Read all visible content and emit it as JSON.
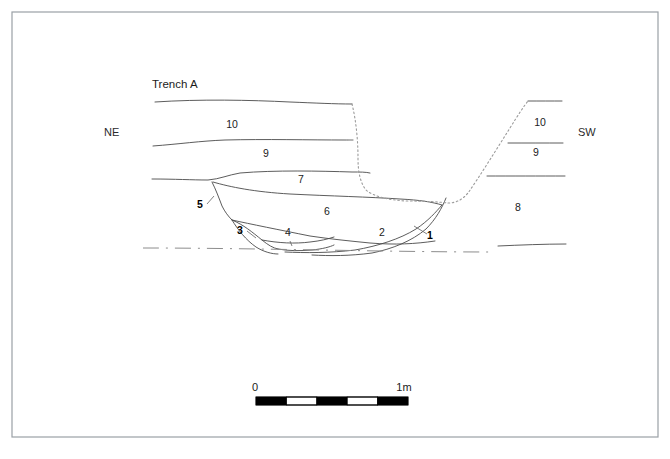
{
  "figure": {
    "title": "Trench A",
    "frame": {
      "x": 12,
      "y": 12,
      "width": 646,
      "height": 425,
      "color": "#9aa0a6"
    }
  },
  "orientation": {
    "left_label": "NE",
    "right_label": "SW",
    "left_pos": {
      "x": 104,
      "y": 136
    },
    "right_pos": {
      "x": 578,
      "y": 136
    }
  },
  "title_pos": {
    "x": 152,
    "y": 88
  },
  "context_labels": [
    {
      "id": "ctx-10-left",
      "text": "10",
      "x": 232,
      "y": 128,
      "bold": false
    },
    {
      "id": "ctx-9-left",
      "text": "9",
      "x": 266,
      "y": 157,
      "bold": false
    },
    {
      "id": "ctx-7",
      "text": "7",
      "x": 301,
      "y": 183,
      "bold": false
    },
    {
      "id": "ctx-5",
      "text": "5",
      "x": 200,
      "y": 208,
      "bold": true
    },
    {
      "id": "ctx-6",
      "text": "6",
      "x": 327,
      "y": 215,
      "bold": false
    },
    {
      "id": "ctx-3",
      "text": "3",
      "x": 240,
      "y": 234,
      "bold": true
    },
    {
      "id": "ctx-4",
      "text": "4",
      "x": 288,
      "y": 236,
      "bold": false
    },
    {
      "id": "ctx-2",
      "text": "2",
      "x": 382,
      "y": 236,
      "bold": false
    },
    {
      "id": "ctx-1",
      "text": "1",
      "x": 430,
      "y": 239,
      "bold": true
    },
    {
      "id": "ctx-10-right",
      "text": "10",
      "x": 540,
      "y": 126,
      "bold": false
    },
    {
      "id": "ctx-9-right",
      "text": "9",
      "x": 536,
      "y": 156,
      "bold": false
    },
    {
      "id": "ctx-8",
      "text": "8",
      "x": 518,
      "y": 211,
      "bold": false
    }
  ],
  "scale_bar": {
    "left_label": "0",
    "right_label": "1m",
    "left_label_pos": {
      "x": 255,
      "y": 391
    },
    "right_label_pos": {
      "x": 404,
      "y": 391
    },
    "x": 256,
    "y": 397,
    "width": 152,
    "height": 8,
    "segments": 5,
    "colors": {
      "dark": "#000000",
      "light": "#ffffff"
    }
  },
  "geometry": {
    "layer_lines": [
      {
        "name": "ground-surface-left",
        "d": "M 155 102 C 200 99 250 100 290 102 C 315 103 335 104 352 104"
      },
      {
        "name": "layer-10-9-boundary",
        "d": "M 153 146 C 180 144 200 141 225 140 C 265 139 310 140 345 140 C 350 140 352 140 353 140"
      },
      {
        "name": "layer-9-7-boundary",
        "d": "M 152 179 C 175 179 192 180 208 180 C 220 179 228 175 240 173 C 275 170 320 171 352 172 C 360 172 366 172 370 173"
      },
      {
        "name": "layer-7-6-boundary",
        "d": "M 213 182 C 230 187 255 192 290 194 C 330 196 370 197 400 199 C 420 200 432 202 442 205"
      },
      {
        "name": "cut-5-edge",
        "d": "M 212 182 C 216 190 219 198 222 206 C 225 212 228 216 232 220"
      },
      {
        "name": "layer-6-base",
        "d": "M 232 220 C 250 224 280 230 310 236 C 330 239 350 241 370 243 C 395 245 415 244 435 241"
      },
      {
        "name": "layer-3-4-upper",
        "d": "M 232 220 C 244 225 252 232 262 240 C 268 245 273 248 278 249"
      },
      {
        "name": "layer-4-base",
        "d": "M 262 240 C 278 243 295 244 310 242 C 320 241 328 239 334 237"
      },
      {
        "name": "layer-4-bottom",
        "d": "M 278 249 C 288 251 300 251 312 250 C 322 249 330 247 334 245"
      },
      {
        "name": "layer-3-bottom",
        "d": "M 232 220 C 238 230 246 240 256 247 C 264 252 272 254 278 254"
      },
      {
        "name": "pit-cut-outer",
        "d": "M 442 205 C 436 212 428 221 416 229 C 400 239 378 246 355 250 C 330 253 305 253 285 252"
      },
      {
        "name": "pit-cut-inner-1",
        "d": "M 446 198 C 442 208 436 219 426 229 C 412 241 392 249 372 253 C 350 256 330 256 312 255"
      }
    ],
    "dotted_cuts": [
      {
        "name": "cut-left-vertical",
        "d": "M 352 104 C 356 120 358 140 358 158 C 358 172 360 182 366 190 C 374 197 390 200 406 201 C 425 201 440 202 448 203"
      },
      {
        "name": "cut-right-slope",
        "d": "M 448 203 C 456 203 462 200 468 193 C 480 176 496 150 510 128 C 518 115 524 106 528 101"
      }
    ],
    "right_bank_lines": [
      {
        "name": "rb-surface",
        "d": "M 528 101 C 540 101 552 101 562 101"
      },
      {
        "name": "rb-10-9",
        "d": "M 508 143 C 525 143 545 143 563 143"
      },
      {
        "name": "rb-9-8",
        "d": "M 487 176 C 510 176 540 176 565 176"
      },
      {
        "name": "rb-lower",
        "d": "M 498 246 C 520 245 545 244 566 244"
      }
    ],
    "base_dashdot": {
      "name": "natural-base",
      "d": "M 143 248 C 200 248 260 249 320 250 C 380 251 440 252 492 252"
    },
    "leaders": [
      {
        "name": "leader-5",
        "d": "M 207 204 L 214 196"
      },
      {
        "name": "leader-3",
        "d": "M 247 231 L 256 238"
      },
      {
        "name": "leader-1",
        "d": "M 427 234 L 414 226"
      },
      {
        "name": "leader-4",
        "d": "M 290 241 L 292 246"
      }
    ]
  }
}
